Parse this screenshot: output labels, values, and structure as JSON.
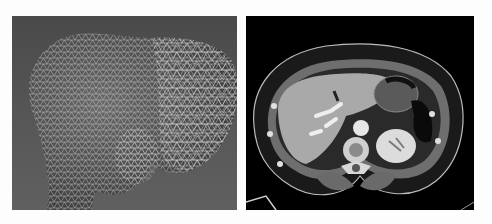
{
  "figure": {
    "panels": [
      {
        "id": "left",
        "subject": "3D wireframe triangle mesh of proximal bone (humeral head)",
        "background": "#555555",
        "mesh_color": "#d8d8d8"
      },
      {
        "id": "right",
        "subject": "Axial contrast-enhanced abdominal CT slice (liver, kidney, spine, stomach)",
        "background": "#000000"
      }
    ]
  }
}
